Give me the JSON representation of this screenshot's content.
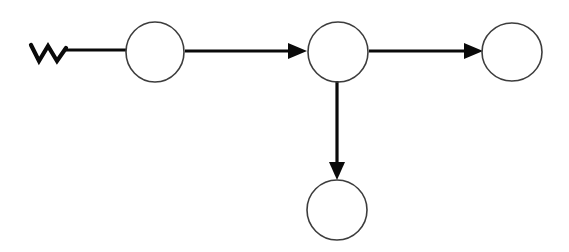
{
  "diagram": {
    "type": "node-link-diagram",
    "background_color": "#ffffff",
    "canvas": {
      "width": 569,
      "height": 252
    },
    "style": {
      "node_stroke_color": "#3d3d3d",
      "node_stroke_width": 1.6,
      "node_fill": "none",
      "edge_stroke_color": "#0a0a0a",
      "edge_stroke_width": 3.2,
      "arrow_fill_color": "#0a0a0a",
      "squiggle_stroke_color": "#0a0a0a",
      "squiggle_stroke_width": 4.2
    },
    "nodes": [
      {
        "id": "node-1",
        "name": "node-left",
        "label": "",
        "shape": "ellipse",
        "cx": 155,
        "cy": 52,
        "rx": 29,
        "ry": 30
      },
      {
        "id": "node-2",
        "name": "node-center-hub",
        "label": "",
        "shape": "ellipse",
        "cx": 338,
        "cy": 52,
        "rx": 30,
        "ry": 30
      },
      {
        "id": "node-3",
        "name": "node-right",
        "label": "",
        "shape": "ellipse",
        "cx": 512,
        "cy": 52,
        "rx": 30,
        "ry": 29
      },
      {
        "id": "node-4",
        "name": "node-bottom",
        "label": "",
        "shape": "ellipse",
        "cx": 337,
        "cy": 210,
        "rx": 30,
        "ry": 30
      }
    ],
    "edges": [
      {
        "id": "edge-start-to-node-1",
        "name": "edge-entry-to-node-left",
        "label": "",
        "from": "start-marker",
        "to": "node-1",
        "orientation": "horizontal",
        "arrowhead": false,
        "path": "M 66 50 L 126 50"
      },
      {
        "id": "edge-node-1-to-node-2",
        "name": "edge-node-left-to-node-center",
        "label": "",
        "from": "node-1",
        "to": "node-2",
        "orientation": "horizontal",
        "arrowhead": true,
        "path": "M 185 51 L 288 51",
        "arrow_points": "288,43 307,51 288,59"
      },
      {
        "id": "edge-node-2-to-node-3",
        "name": "edge-node-center-to-node-right",
        "label": "",
        "from": "node-2",
        "to": "node-3",
        "orientation": "horizontal",
        "arrowhead": true,
        "path": "M 369 51 L 464 51",
        "arrow_points": "464,43 483,51 464,59"
      },
      {
        "id": "edge-node-2-to-node-4",
        "name": "edge-node-center-to-node-bottom",
        "label": "",
        "from": "node-2",
        "to": "node-4",
        "orientation": "vertical",
        "arrowhead": true,
        "path": "M 337 81 L 337 162",
        "arrow_points": "329,162 345,162 337,180"
      }
    ],
    "start_marker": {
      "id": "start-marker",
      "name": "zigzag-start-icon",
      "label": "",
      "shape": "zigzag",
      "description": "W-shaped squiggle terminal at the left end of the first connector",
      "path": "M 31 45 L 39 61 L 48 46 L 57 61 L 66 48"
    }
  }
}
